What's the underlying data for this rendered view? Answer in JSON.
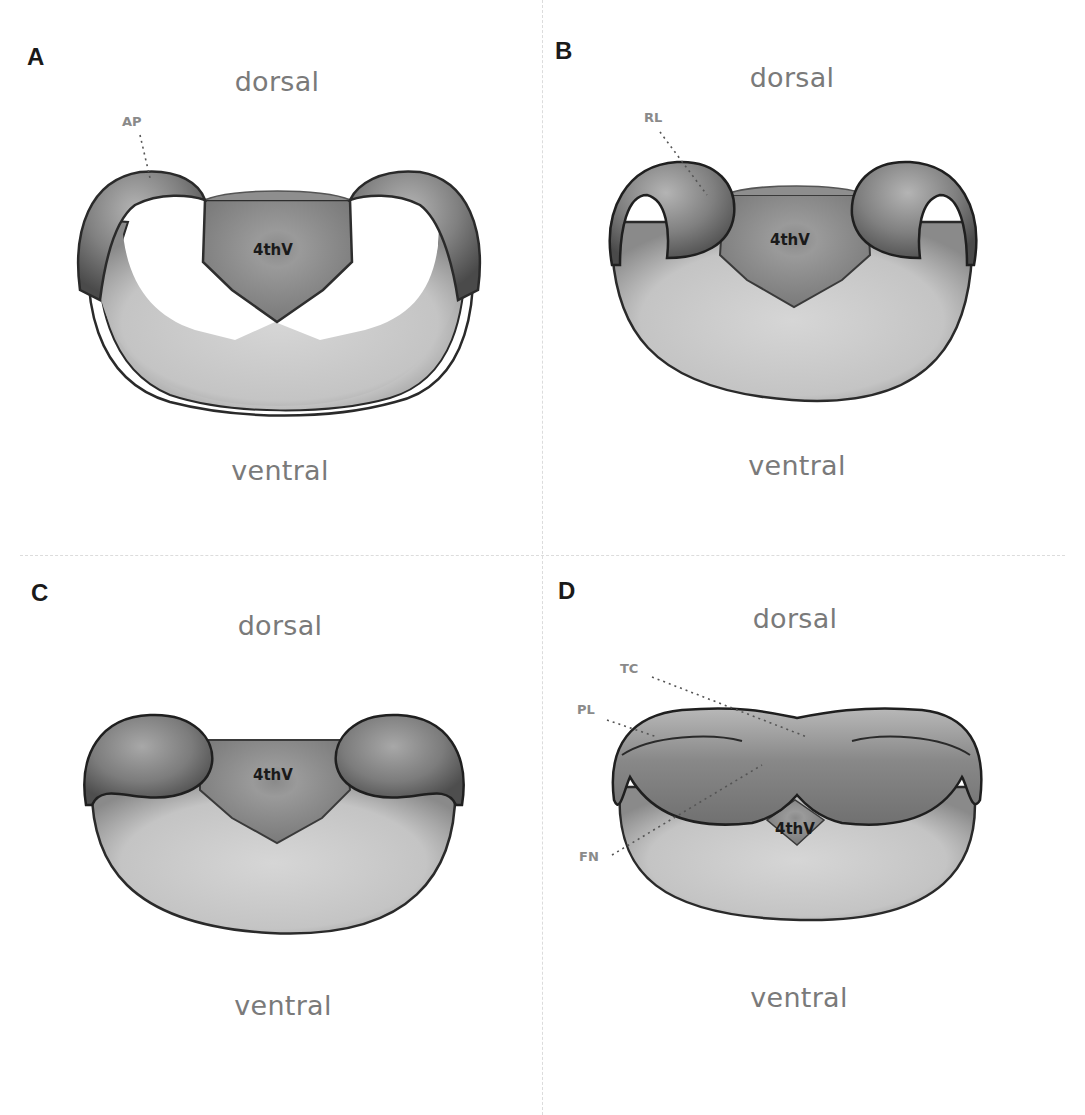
{
  "figure": {
    "panels": [
      {
        "id": "A",
        "letter": "A",
        "dorsal": "dorsal",
        "ventral": "ventral",
        "ventricle": "4thV",
        "structures": [
          {
            "label": "AP"
          }
        ]
      },
      {
        "id": "B",
        "letter": "B",
        "dorsal": "dorsal",
        "ventral": "ventral",
        "ventricle": "4thV",
        "structures": [
          {
            "label": "RL"
          }
        ]
      },
      {
        "id": "C",
        "letter": "C",
        "dorsal": "dorsal",
        "ventral": "ventral",
        "ventricle": "4thV",
        "structures": []
      },
      {
        "id": "D",
        "letter": "D",
        "dorsal": "dorsal",
        "ventral": "ventral",
        "ventricle": "4thV",
        "structures": [
          {
            "label": "TC"
          },
          {
            "label": "PL"
          },
          {
            "label": "FN"
          }
        ]
      }
    ],
    "colors": {
      "outline": "#2a2a2a",
      "body_fill": "#c8c8c8",
      "ventricle_fill": "#8c8c8c",
      "lip_fill": "#6e6e6e",
      "label_gray": "#7a7a7a",
      "divider": "#dcdcdc"
    }
  }
}
